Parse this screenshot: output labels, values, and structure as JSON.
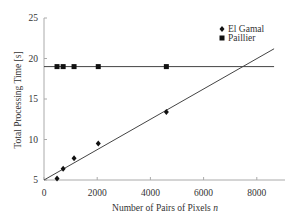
{
  "chart_data": {
    "type": "scatter",
    "title": "",
    "xlabel": "Number of Pairs of Pixels n",
    "ylabel": "Total Processing Time [s]",
    "xlim": [
      0,
      9000
    ],
    "ylim": [
      5,
      25
    ],
    "xticks": [
      0,
      2000,
      4000,
      6000,
      8000
    ],
    "yticks": [
      5,
      10,
      15,
      20,
      25
    ],
    "grid": false,
    "legend_position": "upper right",
    "series": [
      {
        "name": "El Gamal",
        "marker": "diamond",
        "x": [
          490,
          720,
          1130,
          2040,
          4600
        ],
        "y": [
          5.2,
          6.4,
          7.7,
          9.5,
          13.4
        ],
        "trendline": {
          "type": "linear",
          "x": [
            0,
            8650
          ],
          "y": [
            5.0,
            21.2
          ]
        }
      },
      {
        "name": "Paillier",
        "marker": "square",
        "x": [
          490,
          720,
          1130,
          2040,
          4600
        ],
        "y": [
          19.0,
          19.0,
          19.0,
          19.0,
          19.0
        ],
        "trendline": {
          "type": "linear",
          "x": [
            0,
            8650
          ],
          "y": [
            19.0,
            19.0
          ]
        }
      }
    ]
  },
  "labels": {
    "xlabel_main": "Number of Pairs of Pixels ",
    "xlabel_var": "n",
    "ylabel": "Total Processing Time [s]",
    "legend": [
      "El Gamal",
      "Paillier"
    ],
    "xticks": [
      "0",
      "2000",
      "4000",
      "6000",
      "8000"
    ],
    "yticks": [
      "5",
      "10",
      "15",
      "20",
      "25"
    ]
  }
}
